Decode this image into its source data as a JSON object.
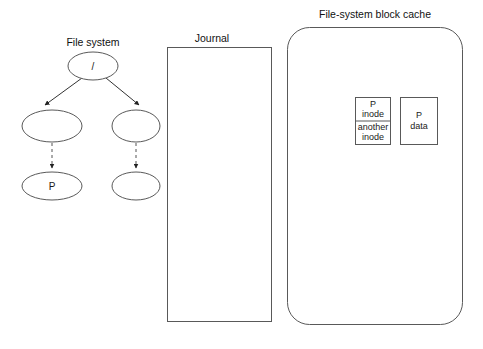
{
  "figure": {
    "background_color": "#ffffff",
    "width": 483,
    "height": 349
  },
  "filesystem": {
    "title": "File system",
    "root_node": {
      "label": "/"
    },
    "mid_left_node": {
      "label": ""
    },
    "mid_right_node": {
      "label": ""
    },
    "leaf_left_node": {
      "label": "P"
    },
    "leaf_right_node": {
      "label": ""
    },
    "edges": {
      "root_to_left": "solid",
      "root_to_right": "solid",
      "left_to_leaf": "dashed",
      "right_to_leaf": "dashed"
    }
  },
  "journal": {
    "title": "Journal",
    "contents": ""
  },
  "cache": {
    "title": "File-system block cache",
    "blocks": [
      {
        "name": "inode-block",
        "cells": [
          {
            "line1": "P",
            "line2": "inode"
          },
          {
            "line1": "another",
            "line2": "inode"
          }
        ]
      },
      {
        "name": "data-block",
        "cells": [
          {
            "line1": "P",
            "line2": "data"
          }
        ]
      }
    ]
  },
  "colors": {
    "stroke": "#595959",
    "edge": "#333333",
    "text": "#1a1a1a",
    "background": "#ffffff"
  }
}
